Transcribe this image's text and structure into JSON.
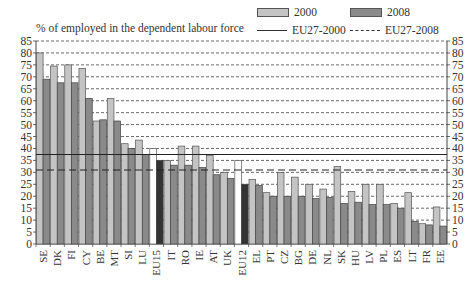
{
  "chart_data": {
    "type": "bar",
    "title": "% of employed in the dependent labour force",
    "xlabel": "",
    "ylabel": "% of employed in the dependent labour force",
    "ylim": [
      0,
      85
    ],
    "yticks": [
      0,
      5,
      10,
      15,
      20,
      25,
      30,
      35,
      40,
      45,
      50,
      55,
      60,
      65,
      70,
      75,
      80,
      85
    ],
    "grid": "horizontal dashed",
    "axis_labels_both_sides": true,
    "legend_position": "top-right",
    "categories": [
      "SE",
      "DK",
      "FI",
      "CY",
      "BE",
      "MT",
      "SI",
      "LU",
      "EU15",
      "IT",
      "RO",
      "IE",
      "AT",
      "UK",
      "EU12",
      "EL",
      "PT",
      "CZ",
      "BG",
      "DE",
      "NL",
      "SK",
      "HU",
      "LV",
      "PL",
      "ES",
      "LT",
      "FR",
      "EE"
    ],
    "series": [
      {
        "name": "2000",
        "color": "#c4c4c4",
        "values": [
          80,
          74.5,
          75,
          73.5,
          51.5,
          61,
          42,
          43.5,
          40,
          35,
          41,
          41,
          37,
          30,
          35,
          27,
          21.5,
          30,
          28,
          25,
          23,
          32.5,
          22,
          25,
          25,
          17,
          21.5,
          8.5,
          15.5
        ]
      },
      {
        "name": "2008",
        "color": "#8a8a8a",
        "values": [
          69,
          67.5,
          67.5,
          61,
          52,
          51.5,
          40,
          37.5,
          35,
          33,
          33,
          32,
          29,
          27.5,
          25,
          24.5,
          20,
          20,
          20,
          19,
          19.5,
          17,
          17.5,
          16.5,
          16.5,
          15,
          9.5,
          8,
          7.5
        ]
      }
    ],
    "highlight_categories": {
      "EU15": {
        "2000": "#ffffff",
        "2008": "#333333"
      },
      "EU12": {
        "2000": "#ffffff",
        "2008": "#333333"
      }
    },
    "reference_lines": [
      {
        "name": "EU27-2000",
        "value": 37.5,
        "style": "solid"
      },
      {
        "name": "EU27-2008",
        "value": 31,
        "style": "dashed"
      }
    ]
  },
  "legend": {
    "items": [
      {
        "label": "2000",
        "kind": "bar",
        "color": "#c4c4c4"
      },
      {
        "label": "2008",
        "kind": "bar",
        "color": "#8a8a8a"
      },
      {
        "label": "EU27-2000",
        "kind": "solid-line"
      },
      {
        "label": "EU27-2008",
        "kind": "dashed-line"
      }
    ]
  }
}
